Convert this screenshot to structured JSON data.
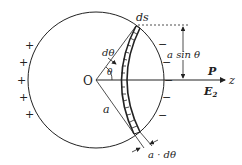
{
  "diagram": {
    "labels": {
      "origin": "O",
      "ds": "ds",
      "dtheta": "dθ",
      "theta": "θ",
      "radius": "a",
      "height": "a sin θ",
      "polarization": "P",
      "field": "E",
      "field_sub": "2",
      "axis": "z",
      "width": "a · dθ"
    },
    "charges": {
      "left": [
        "+",
        "+",
        "+",
        "+",
        "+"
      ],
      "right": [
        "−",
        "−",
        "−",
        "−",
        "−"
      ]
    },
    "colors": {
      "stroke": "#222222",
      "background": "#ffffff"
    }
  }
}
